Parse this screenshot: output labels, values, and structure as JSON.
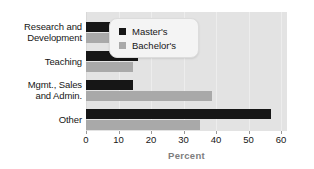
{
  "chart_data": {
    "type": "bar",
    "orientation": "horizontal",
    "title": "",
    "xlabel": "Percent",
    "ylabel": "",
    "xlim": [
      0,
      60
    ],
    "xticks": [
      0,
      10,
      20,
      30,
      40,
      50,
      60
    ],
    "xtick_labels": [
      "0",
      "10",
      "20",
      "30",
      "40",
      "50",
      "60"
    ],
    "grid": true,
    "legend_position": "upper right inside plot",
    "categories": [
      "Research and Development",
      "Teaching",
      "Mgmt., Sales and Admin.",
      "Other"
    ],
    "category_lines": [
      [
        "Research and",
        "Development"
      ],
      [
        "Teaching"
      ],
      [
        "Mgmt., Sales",
        "and Admin."
      ],
      [
        "Other"
      ]
    ],
    "series": [
      {
        "name": "Master's",
        "color": "#161616",
        "values": [
          11.7,
          16.0,
          14.5,
          57.0
        ]
      },
      {
        "name": "Bachelor's",
        "color": "#a9a9a9",
        "values": [
          8.3,
          14.5,
          38.8,
          35.0
        ]
      }
    ]
  },
  "legend": {
    "items": [
      {
        "label": "Master's",
        "swatch": "masters"
      },
      {
        "label": "Bachelor's",
        "swatch": "bachelors"
      }
    ]
  },
  "colors": {
    "masters": "#161616",
    "bachelors": "#a9a9a9",
    "plot_background": "#e3e3e3",
    "page_background": "#ffffff",
    "axis_title": "#7d7d7d"
  }
}
